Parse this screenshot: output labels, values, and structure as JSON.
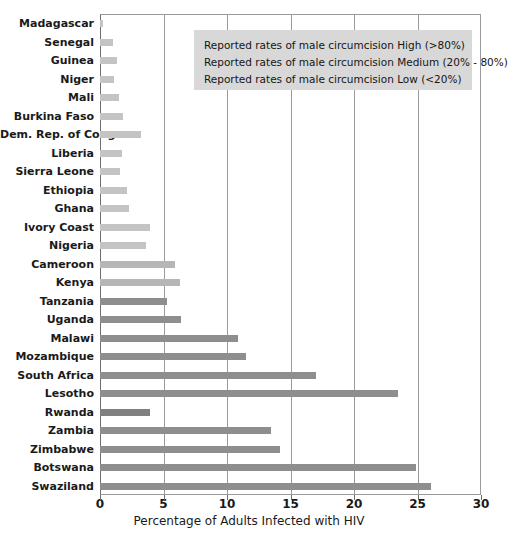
{
  "chart_data": {
    "type": "bar",
    "orientation": "horizontal",
    "title": "HIV Rates and Male Circumcision in Africa",
    "xlabel": "Percentage of Adults Infected with HIV",
    "ylabel": "",
    "xlim": [
      0,
      30
    ],
    "xticks": [
      0,
      5,
      10,
      15,
      20,
      25,
      30
    ],
    "grid": "vertical",
    "categories": [
      "Madagascar",
      "Senegal",
      "Guinea",
      "Niger",
      "Mali",
      "Burkina Faso",
      "Dem. Rep. of Congo",
      "Liberia",
      "Sierra Leone",
      "Ethiopia",
      "Ghana",
      "Ivory Coast",
      "Nigeria",
      "Cameroon",
      "Kenya",
      "Tanzania",
      "Uganda",
      "Malawi",
      "Mozambique",
      "South Africa",
      "Lesotho",
      "Rwanda",
      "Zambia",
      "Zimbabwe",
      "Botswana",
      "Swaziland"
    ],
    "values": [
      0.2,
      1.0,
      1.3,
      1.1,
      1.5,
      1.8,
      3.2,
      1.7,
      1.6,
      2.1,
      2.3,
      3.9,
      3.6,
      5.9,
      6.3,
      5.3,
      6.4,
      10.9,
      11.5,
      17.0,
      23.5,
      3.9,
      13.5,
      14.2,
      24.9,
      26.1
    ],
    "bar_colors": [
      "#c4c4c4",
      "#c4c4c4",
      "#c4c4c4",
      "#c4c4c4",
      "#c4c4c4",
      "#c4c4c4",
      "#c4c4c4",
      "#c4c4c4",
      "#c4c4c4",
      "#c4c4c4",
      "#c4c4c4",
      "#c4c4c4",
      "#c4c4c4",
      "#b6b6b6",
      "#b6b6b6",
      "#8e8e8e",
      "#8e8e8e",
      "#8e8e8e",
      "#8e8e8e",
      "#8e8e8e",
      "#8e8e8e",
      "#808080",
      "#8e8e8e",
      "#8e8e8e",
      "#8e8e8e",
      "#8e8e8e"
    ],
    "legend": {
      "position": "top-right-inside",
      "entries": [
        "Reported rates of male circumcision High (>80%)",
        "Reported rates of male circumcision Medium (20% - 80%)",
        "Reported rates of male circumcision Low (<20%)"
      ]
    },
    "colors": {
      "axis": "#6e6e6e",
      "grid": "#9a9a9a",
      "legend_background": "#d8d8d8",
      "text": "#1a1a1a",
      "bar_light": "#c4c4c4",
      "bar_medium": "#b6b6b6",
      "bar_dark": "#8e8e8e"
    }
  }
}
